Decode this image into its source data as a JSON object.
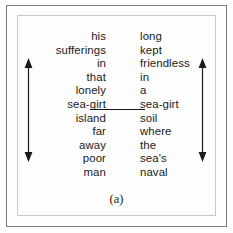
{
  "figure": {
    "caption": "(a)",
    "background_color": "#fdfdfd",
    "text_color": "#1a1a1a",
    "frame_color": "#7c7c7c",
    "inner_frame_color": "#c9c9c9"
  },
  "columns": {
    "left": {
      "alignment": "right",
      "words": [
        "his",
        "sufferings",
        "in",
        "that",
        "lonely",
        "sea-girt",
        "island",
        "far",
        "away",
        "poor",
        "man"
      ]
    },
    "right": {
      "alignment": "left",
      "words": [
        "long",
        "kept",
        "friendless",
        "in",
        "a",
        "sea-girt",
        "soil",
        "where",
        "the",
        "sea's",
        "naval"
      ]
    }
  },
  "connector": {
    "from_word": "sea-girt",
    "to_word": "sea-girt",
    "row_index": 5,
    "color": "#1a1a1a"
  },
  "arrows": {
    "left": {
      "style": "double-headed-vertical",
      "color": "#1a1a1a"
    },
    "right": {
      "style": "double-headed-vertical",
      "color": "#1a1a1a"
    }
  }
}
